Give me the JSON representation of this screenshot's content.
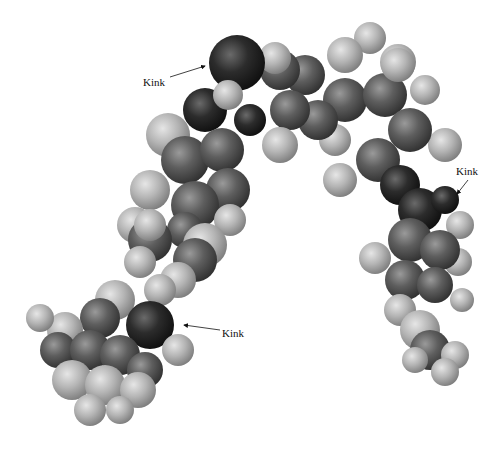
{
  "figure": {
    "labels": [
      {
        "id": "kink-top",
        "text": "Kink",
        "x": 143,
        "y": 86,
        "arrow": {
          "x1": 170,
          "y1": 77,
          "x2": 207,
          "y2": 65
        }
      },
      {
        "id": "kink-right",
        "text": "Kink",
        "x": 456,
        "y": 175,
        "arrow": {
          "x1": 470,
          "y1": 178,
          "x2": 456,
          "y2": 193
        }
      },
      {
        "id": "kink-bottom",
        "text": "Kink",
        "x": 222,
        "y": 337,
        "arrow": {
          "x1": 220,
          "y1": 330,
          "x2": 183,
          "y2": 325
        }
      }
    ],
    "colors": {
      "carbon": "#5a5a5a",
      "hydrogen": "#b8b8b8",
      "heteroatom": "#2a2a2a",
      "background": "#ffffff"
    }
  }
}
